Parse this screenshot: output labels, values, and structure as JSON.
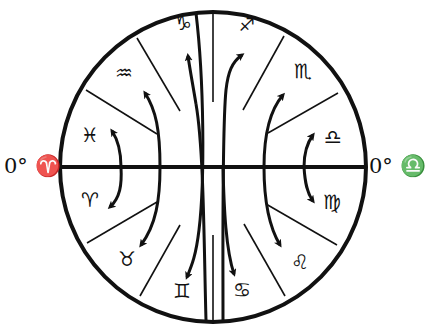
{
  "diagram": {
    "type": "zodiac-circle",
    "left_label": "0° ♈",
    "right_label": "0° ♎",
    "signs": [
      {
        "name": "capricorn",
        "glyph": "♑",
        "x": 183,
        "y": 23,
        "size": 20
      },
      {
        "name": "sagittarius",
        "glyph": "♐",
        "x": 247,
        "y": 25,
        "size": 18
      },
      {
        "name": "aquarius",
        "glyph": "♒",
        "x": 124,
        "y": 73,
        "size": 20
      },
      {
        "name": "scorpio",
        "glyph": "♏",
        "x": 303,
        "y": 71,
        "size": 20
      },
      {
        "name": "pisces",
        "glyph": "♓",
        "x": 90,
        "y": 135,
        "size": 20
      },
      {
        "name": "libra",
        "glyph": "♎",
        "x": 333,
        "y": 137,
        "size": 20
      },
      {
        "name": "aries",
        "glyph": "♈",
        "x": 90,
        "y": 200,
        "size": 20
      },
      {
        "name": "virgo",
        "glyph": "♍",
        "x": 332,
        "y": 202,
        "size": 20
      },
      {
        "name": "taurus",
        "glyph": "♉",
        "x": 127,
        "y": 259,
        "size": 20
      },
      {
        "name": "leo",
        "glyph": "♌",
        "x": 300,
        "y": 262,
        "size": 20
      },
      {
        "name": "gemini",
        "glyph": "♊",
        "x": 182,
        "y": 291,
        "size": 20
      },
      {
        "name": "cancer",
        "glyph": "♋",
        "x": 242,
        "y": 290,
        "size": 20
      }
    ],
    "colors": {
      "ink": "#111111",
      "background": "#ffffff"
    }
  }
}
